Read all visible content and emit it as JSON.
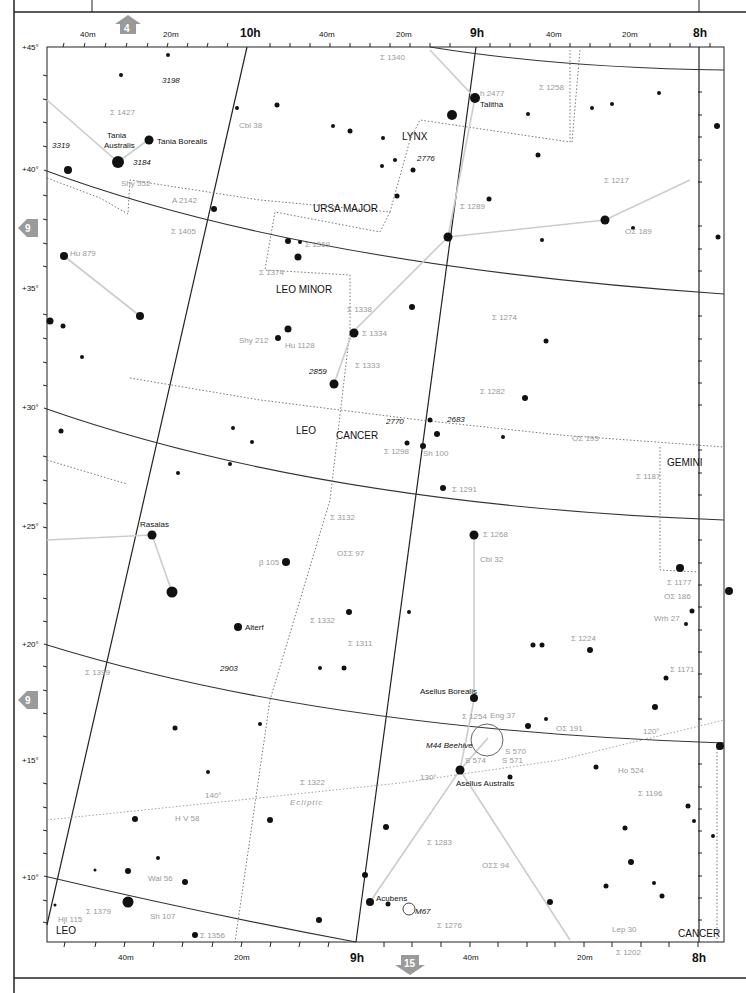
{
  "map": {
    "title": "Star chart — Cancer / Leo / Leo Minor / Lynx region",
    "ra_labels_top": [
      "40m",
      "20m",
      "10h",
      "40m",
      "20m",
      "9h",
      "40m",
      "20m",
      "8h"
    ],
    "ra_labels_bottom": [
      "40m",
      "20m",
      "9h",
      "40m",
      "20m",
      "8h"
    ],
    "dec_labels": [
      "+45°",
      "+40°",
      "+35°",
      "+30°",
      "+25°",
      "+20°",
      "+15°",
      "+10°"
    ],
    "nav": {
      "up": "4",
      "left_top": "9",
      "left_bottom": "9",
      "down": "15"
    },
    "constellations": [
      "LYNX",
      "URSA MAJOR",
      "LEO MINOR",
      "LEO",
      "CANCER",
      "GEMINI",
      "LEO",
      "CANCER"
    ],
    "named_stars": [
      "Tania Australis",
      "Tania Borealis",
      "Talitha",
      "Rasalas",
      "Alterf",
      "Asellus Borealis",
      "Asellus Australis",
      "Acubens"
    ],
    "objects": [
      "M44 Beehive",
      "M67",
      "3198",
      "3319",
      "3184",
      "2776",
      "2859",
      "2770",
      "2683",
      "2903"
    ],
    "double_stars": [
      "Σ 1340",
      "Σ 1427",
      "Cbl 38",
      "h 2477",
      "Σ 1258",
      "Shy 552",
      "A 2142",
      "Σ 1405",
      "Σ 1217",
      "Σ 1289",
      "Hu 879",
      "Σ 1369",
      "Σ 1374",
      "OΣ 189",
      "Σ 1338",
      "Σ 1274",
      "Σ 1334",
      "Shy 212",
      "Hu 1128",
      "Σ 1333",
      "Σ 1282",
      "OΣ 193",
      "Σ 1298",
      "Sh 100",
      "Σ 1187",
      "Σ 1291",
      "Σ 3132",
      "Σ 1268",
      "OΣΣ 97",
      "Cbl 32",
      "β 105",
      "Σ 1177",
      "OΣ 186",
      "Wrh 27",
      "Σ 1332",
      "Σ 1224",
      "Σ 1311",
      "Σ 1171",
      "Σ 1399",
      "Σ 1254",
      "Eng 37",
      "OΣ 191",
      "S 570",
      "S 574",
      "S 571",
      "Ho 524",
      "Σ 1322",
      "H V 58",
      "Σ 1196",
      "Σ 1283",
      "OΣΣ 94",
      "Wal 56",
      "Σ 1379",
      "Hjl 115",
      "Sh 107",
      "Σ 1356",
      "Σ 1276",
      "Lep 30",
      "Σ 1202"
    ],
    "ecliptic_label": "Ecliptic",
    "ecliptic_marks": [
      "140°",
      "130°",
      "120°"
    ]
  }
}
